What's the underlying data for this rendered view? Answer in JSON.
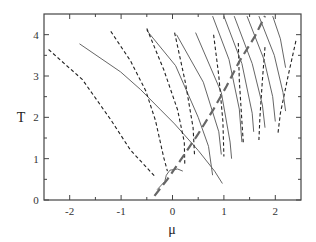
{
  "chart_data": {
    "type": "line",
    "title": "",
    "xlabel": "μ",
    "ylabel": "T",
    "xlim": [
      -2.5,
      2.5
    ],
    "ylim": [
      0,
      4.5
    ],
    "xticks": [
      -2,
      -1,
      0,
      1,
      2
    ],
    "xtick_labels": [
      "-2",
      "-1",
      "0",
      "1",
      "2"
    ],
    "xminor": [
      -2.5,
      -1.5,
      -0.5,
      0.5,
      1.5
    ],
    "yticks": [
      0,
      1,
      2,
      3,
      4
    ],
    "ytick_labels": [
      "0",
      "1",
      "2",
      "3",
      "4"
    ],
    "yminor": [
      0.5,
      1.5,
      2.5,
      3.5
    ],
    "grid": false,
    "legend": null,
    "series": [
      {
        "name": "dashed-1",
        "style": "dashed",
        "points": [
          [
            -2.41,
            3.64
          ],
          [
            -1.75,
            2.91
          ],
          [
            -1.2,
            1.94
          ],
          [
            -0.82,
            1.21
          ],
          [
            -0.35,
            0.58
          ]
        ]
      },
      {
        "name": "solid-1",
        "style": "solid",
        "points": [
          [
            -1.81,
            3.78
          ],
          [
            -1.01,
            3.1
          ],
          [
            -0.62,
            2.67
          ],
          [
            -0.23,
            2.18
          ],
          [
            0.04,
            1.84
          ],
          [
            0.5,
            1.2
          ],
          [
            0.82,
            0.7
          ],
          [
            0.97,
            0.4
          ]
        ]
      },
      {
        "name": "dashed-2",
        "style": "dashed",
        "points": [
          [
            -1.2,
            4.08
          ],
          [
            -0.82,
            3.37
          ],
          [
            -0.52,
            2.64
          ],
          [
            -0.33,
            1.92
          ],
          [
            -0.17,
            1.02
          ],
          [
            -0.1,
            0.7
          ]
        ]
      },
      {
        "name": "solid-2",
        "style": "solid",
        "points": [
          [
            -0.5,
            4.1
          ],
          [
            0.06,
            3.25
          ],
          [
            0.5,
            2.0
          ],
          [
            0.7,
            1.3
          ],
          [
            0.78,
            0.6
          ]
        ]
      },
      {
        "name": "dashed-3",
        "style": "dashed",
        "points": [
          [
            -0.5,
            4.15
          ],
          [
            -0.17,
            3.15
          ],
          [
            0.1,
            2.18
          ],
          [
            0.23,
            1.4
          ],
          [
            0.24,
            0.85
          ]
        ]
      },
      {
        "name": "solid-3",
        "style": "solid",
        "points": [
          [
            0.08,
            4.0
          ],
          [
            0.6,
            2.85
          ],
          [
            0.9,
            1.65
          ],
          [
            0.95,
            1.1
          ]
        ]
      },
      {
        "name": "dashed-4",
        "style": "dashed",
        "points": [
          [
            0.04,
            4.05
          ],
          [
            0.25,
            2.84
          ],
          [
            0.4,
            1.75
          ],
          [
            0.43,
            1.05
          ]
        ]
      },
      {
        "name": "solid-4",
        "style": "solid",
        "points": [
          [
            0.45,
            4.05
          ],
          [
            0.95,
            2.6
          ],
          [
            1.12,
            1.4
          ],
          [
            1.15,
            1.0
          ]
        ]
      },
      {
        "name": "dashed-5",
        "style": "dashed",
        "points": [
          [
            0.8,
            4.0
          ],
          [
            0.9,
            3.0
          ],
          [
            0.98,
            1.9
          ],
          [
            1.0,
            1.05
          ]
        ]
      },
      {
        "name": "solid-5",
        "style": "solid",
        "points": [
          [
            0.78,
            4.45
          ],
          [
            1.1,
            3.4
          ],
          [
            1.3,
            2.2
          ],
          [
            1.35,
            1.4
          ]
        ]
      },
      {
        "name": "dashed-6",
        "style": "dashed",
        "points": [
          [
            1.28,
            3.8
          ],
          [
            1.3,
            2.9
          ],
          [
            1.35,
            1.9
          ],
          [
            1.38,
            1.35
          ]
        ]
      },
      {
        "name": "solid-6",
        "style": "solid",
        "points": [
          [
            1.0,
            4.45
          ],
          [
            1.35,
            3.3
          ],
          [
            1.55,
            2.1
          ],
          [
            1.58,
            1.65
          ]
        ]
      },
      {
        "name": "dashed-7",
        "style": "dashed",
        "points": [
          [
            1.8,
            3.7
          ],
          [
            1.75,
            2.9
          ],
          [
            1.7,
            2.0
          ],
          [
            1.68,
            1.45
          ]
        ]
      },
      {
        "name": "solid-7",
        "style": "solid",
        "points": [
          [
            1.2,
            4.45
          ],
          [
            1.55,
            3.3
          ],
          [
            1.75,
            2.3
          ],
          [
            1.8,
            1.75
          ]
        ]
      },
      {
        "name": "dashed-8",
        "style": "dashed",
        "points": [
          [
            2.4,
            3.85
          ],
          [
            2.25,
            3.0
          ],
          [
            2.1,
            2.1
          ],
          [
            2.05,
            1.6
          ]
        ]
      },
      {
        "name": "solid-8",
        "style": "solid",
        "points": [
          [
            1.45,
            4.45
          ],
          [
            1.78,
            3.4
          ],
          [
            1.95,
            2.5
          ],
          [
            2.0,
            1.9
          ]
        ]
      },
      {
        "name": "solid-9",
        "style": "solid",
        "points": [
          [
            1.68,
            4.45
          ],
          [
            1.98,
            3.5
          ],
          [
            2.15,
            2.6
          ],
          [
            2.2,
            2.15
          ]
        ]
      },
      {
        "name": "solid-10",
        "style": "solid",
        "points": [
          [
            1.95,
            4.45
          ],
          [
            2.1,
            3.9
          ],
          [
            2.2,
            3.2
          ]
        ]
      },
      {
        "name": "wide-dashed-boundary",
        "style": "longdash",
        "points": [
          [
            -0.35,
            0.1
          ],
          [
            -0.1,
            0.5
          ],
          [
            0.15,
            0.95
          ],
          [
            0.5,
            1.6
          ],
          [
            0.8,
            2.2
          ],
          [
            1.05,
            2.75
          ],
          [
            1.3,
            3.35
          ],
          [
            1.6,
            3.95
          ],
          [
            1.8,
            4.45
          ]
        ]
      },
      {
        "name": "solid-loop",
        "style": "solid",
        "points": [
          [
            -0.3,
            0.25
          ],
          [
            -0.15,
            0.45
          ],
          [
            -0.12,
            0.6
          ],
          [
            -0.05,
            0.72
          ],
          [
            0.1,
            0.75
          ],
          [
            0.2,
            0.7
          ]
        ]
      }
    ]
  }
}
